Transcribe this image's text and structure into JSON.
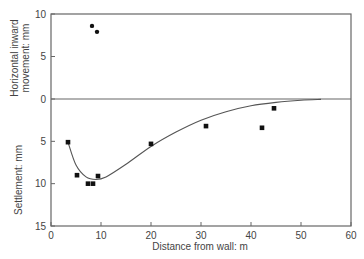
{
  "chart_data": {
    "type": "scatter",
    "title": "",
    "xlabel": "Distance from wall: m",
    "xlim": [
      0,
      60
    ],
    "x_ticks": [
      0,
      10,
      20,
      30,
      40,
      50,
      60
    ],
    "grid": false,
    "legend": null,
    "panels": [
      {
        "name": "horizontal",
        "ylabel": "Horizontal inward movement: mm",
        "ylabel_lines": [
          "Horizontal inward",
          "movement: mm"
        ],
        "ylim": [
          0,
          10
        ],
        "y_ticks": [
          0,
          5,
          10
        ],
        "series": [
          {
            "name": "Horizontal inward movement",
            "marker": "circle",
            "x": [
              8.2,
              9.2
            ],
            "y": [
              8.6,
              7.9
            ]
          }
        ]
      },
      {
        "name": "settlement",
        "ylabel": "Settlement: mm",
        "ylim": [
          15,
          0
        ],
        "y_ticks": [
          5,
          10,
          15
        ],
        "series": [
          {
            "name": "Settlement",
            "marker": "square",
            "x": [
              3.4,
              5.2,
              7.4,
              8.4,
              9.4,
              20,
              31,
              42.2,
              44.6
            ],
            "y": [
              5.1,
              9.0,
              10.0,
              10.0,
              9.1,
              5.3,
              3.2,
              3.4,
              1.1
            ]
          },
          {
            "name": "Trend curve",
            "marker": "none",
            "style": "line",
            "x": [
              3.4,
              5,
              7,
              9,
              11,
              15,
              20,
              25,
              30,
              35,
              40,
              45,
              50,
              54
            ],
            "y": [
              5.1,
              7.8,
              9.2,
              9.5,
              9.2,
              7.7,
              5.6,
              3.9,
              2.5,
              1.5,
              0.8,
              0.4,
              0.15,
              0.05
            ]
          }
        ]
      }
    ]
  }
}
